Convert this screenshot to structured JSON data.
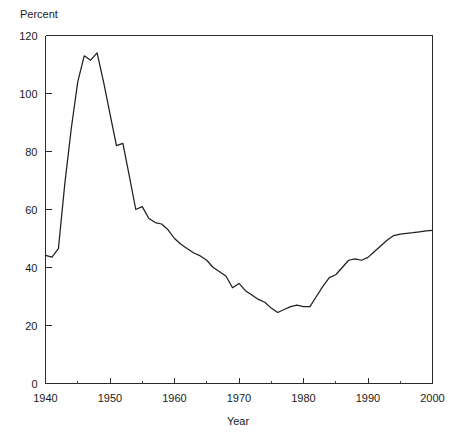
{
  "chart_data": {
    "type": "line",
    "title": "",
    "subtitle": "",
    "xlabel": "Year",
    "ylabel": "Percent",
    "xlim": [
      1940,
      2000
    ],
    "ylim": [
      0,
      120
    ],
    "grid": false,
    "legend": null,
    "legend_position": "none",
    "x_ticks": [
      1940,
      1950,
      1960,
      1970,
      1980,
      1990,
      2000
    ],
    "x_tick_labels": [
      "1940",
      "1950",
      "1960",
      "1970",
      "1980",
      "1990",
      "2000"
    ],
    "x_minor_ticks": [
      1945,
      1955,
      1965,
      1975,
      1985,
      1995
    ],
    "y_ticks": [
      0,
      20,
      40,
      60,
      80,
      100,
      120
    ],
    "y_tick_labels": [
      "0",
      "20",
      "40",
      "60",
      "80",
      "100",
      "120"
    ],
    "line_color": "#1f1f1f",
    "series": [
      {
        "name": "Percent",
        "x": [
          1940,
          1941,
          1942,
          1943,
          1944,
          1945,
          1946,
          1947,
          1948,
          1949,
          1950,
          1951,
          1952,
          1953,
          1954,
          1955,
          1956,
          1957,
          1958,
          1959,
          1960,
          1961,
          1962,
          1963,
          1964,
          1965,
          1966,
          1967,
          1968,
          1969,
          1970,
          1971,
          1972,
          1973,
          1974,
          1975,
          1976,
          1977,
          1978,
          1979,
          1980,
          1981,
          1982,
          1983,
          1984,
          1985,
          1986,
          1987,
          1988,
          1989,
          1990,
          1991,
          1992,
          1993,
          1994,
          1995,
          1996,
          1997,
          1998,
          1999,
          2000
        ],
        "values": [
          44.2,
          43.6,
          46.5,
          69.0,
          88.0,
          104.0,
          113.0,
          111.5,
          114.0,
          104.0,
          93.0,
          82.0,
          82.8,
          71.5,
          60.0,
          61.0,
          57.0,
          55.5,
          55.0,
          53.0,
          50.0,
          48.0,
          46.5,
          45.0,
          44.0,
          42.5,
          40.0,
          38.5,
          37.0,
          33.0,
          34.5,
          32.0,
          30.5,
          29.0,
          28.0,
          26.0,
          24.5,
          25.5,
          26.5,
          27.0,
          26.5,
          26.5,
          30.0,
          33.5,
          36.5,
          37.5,
          40.0,
          42.5,
          43.0,
          42.5,
          43.5,
          45.5,
          47.5,
          49.5,
          51.0,
          51.5,
          51.8,
          52.0,
          52.3,
          52.6,
          52.8
        ]
      }
    ],
    "annotations": []
  }
}
